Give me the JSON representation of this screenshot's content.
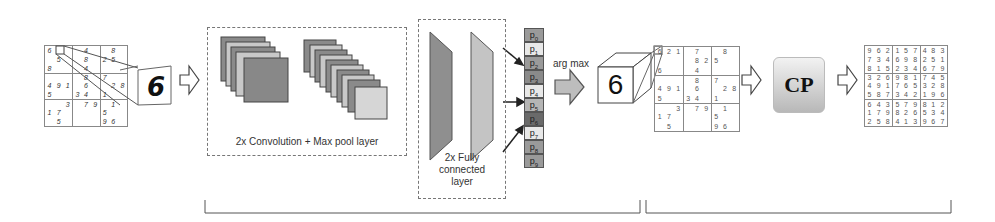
{
  "input_grid": {
    "cells": [
      [
        "6",
        "",
        "",
        "",
        "4",
        "",
        "",
        "8",
        ""
      ],
      [
        "",
        "5",
        "",
        "",
        "8",
        "",
        "2",
        "5",
        ""
      ],
      [
        "8",
        "",
        "",
        "",
        "4",
        "",
        "",
        "",
        ""
      ],
      [
        "",
        "",
        "",
        "",
        "8",
        "",
        "7",
        "",
        ""
      ],
      [
        "4",
        "9",
        "1",
        "",
        "6",
        "",
        "",
        "2",
        "8"
      ],
      [
        "5",
        "",
        "",
        "3",
        "4",
        "",
        "1",
        "",
        ""
      ],
      [
        "",
        "",
        "3",
        "",
        "7",
        "9",
        "",
        "1",
        ""
      ],
      [
        "1",
        "7",
        "",
        "",
        "",
        "",
        "5",
        "",
        ""
      ],
      [
        "",
        "5",
        "",
        "",
        "",
        "",
        "9",
        "6",
        ""
      ]
    ],
    "zoom_digit": "6"
  },
  "conv_block": {
    "label": "2x Convolution + Max pool layer"
  },
  "fc_block": {
    "label_line1": "2x Fully",
    "label_line2": "connected",
    "label_line3": "layer"
  },
  "probabilities": {
    "labels": [
      "p0",
      "p1",
      "p2",
      "p3",
      "p4",
      "p5",
      "p6",
      "p7",
      "p8",
      "p9"
    ],
    "colors": [
      "#9a9a9a",
      "#e8e8e8",
      "#9a9a9a",
      "#8a8a8a",
      "#e8e8e8",
      "#b5b5b5",
      "#6a6a6a",
      "#e8e8e8",
      "#9a9a9a",
      "#9a9a9a"
    ]
  },
  "argmax": {
    "label": "arg max",
    "result_digit": "6"
  },
  "recognized_grid": {
    "cells": [
      [
        "6",
        "2",
        "1",
        "",
        "7",
        "",
        "",
        "8",
        ""
      ],
      [
        "",
        "",
        "",
        "",
        "8",
        "2",
        "5",
        "",
        ""
      ],
      [
        "6",
        "",
        "",
        "",
        "4",
        "",
        "",
        "",
        ""
      ],
      [
        "",
        "",
        "",
        "",
        "8",
        "",
        "7",
        "",
        ""
      ],
      [
        "4",
        "9",
        "1",
        "",
        "6",
        "",
        "",
        "2",
        "8"
      ],
      [
        "5",
        "",
        "",
        "3",
        "4",
        "",
        "1",
        "",
        ""
      ],
      [
        "",
        "",
        "3",
        "",
        "7",
        "9",
        "",
        "1",
        ""
      ],
      [
        "1",
        "7",
        "",
        "",
        "",
        "",
        "5",
        "",
        ""
      ],
      [
        "",
        "5",
        "",
        "",
        "",
        "",
        "9",
        "6",
        ""
      ]
    ]
  },
  "solver": {
    "label": "CP"
  },
  "solved_grid": {
    "cells": [
      [
        "9",
        "6",
        "2",
        "1",
        "5",
        "7",
        "4",
        "8",
        "3"
      ],
      [
        "7",
        "3",
        "4",
        "6",
        "9",
        "8",
        "2",
        "5",
        "1"
      ],
      [
        "8",
        "1",
        "5",
        "2",
        "3",
        "4",
        "6",
        "7",
        "9"
      ],
      [
        "3",
        "2",
        "6",
        "9",
        "8",
        "1",
        "7",
        "4",
        "5"
      ],
      [
        "4",
        "9",
        "1",
        "7",
        "6",
        "5",
        "3",
        "2",
        "8"
      ],
      [
        "5",
        "8",
        "7",
        "3",
        "4",
        "2",
        "1",
        "9",
        "6"
      ],
      [
        "6",
        "4",
        "3",
        "5",
        "7",
        "9",
        "8",
        "1",
        "2"
      ],
      [
        "1",
        "7",
        "9",
        "8",
        "2",
        "6",
        "5",
        "3",
        "4"
      ],
      [
        "2",
        "5",
        "8",
        "4",
        "1",
        "3",
        "9",
        "6",
        "7"
      ]
    ]
  }
}
